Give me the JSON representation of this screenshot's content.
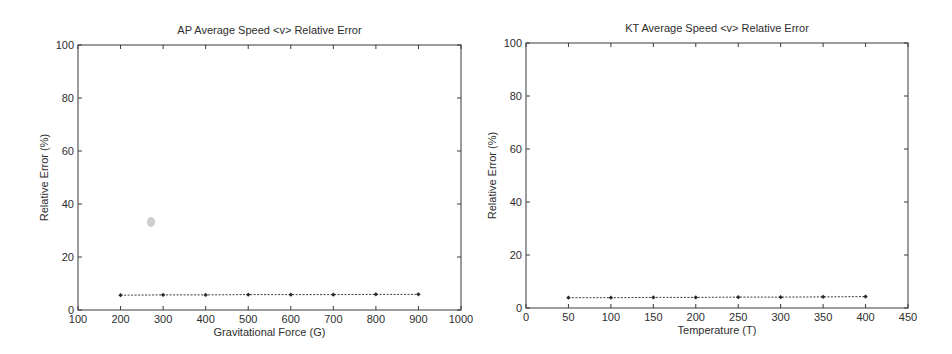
{
  "chart_data": [
    {
      "id": "ap",
      "type": "line",
      "title": "AP Average Speed <v> Relative Error",
      "xlabel": "Gravitational Force (G)",
      "ylabel": "Relative Error (%)",
      "xlim": [
        100,
        1000
      ],
      "ylim": [
        0,
        100
      ],
      "xticks": [
        100,
        200,
        300,
        400,
        500,
        600,
        700,
        800,
        900,
        1000
      ],
      "yticks": [
        0,
        20,
        40,
        60,
        80,
        100
      ],
      "grid": false,
      "legend": null,
      "series": [
        {
          "name": "AP <v> relative error",
          "style": "dotted line with diamond markers",
          "x": [
            200,
            300,
            400,
            500,
            600,
            700,
            800,
            900
          ],
          "y": [
            5.6,
            5.7,
            5.7,
            5.8,
            5.8,
            5.8,
            5.9,
            5.9
          ]
        }
      ],
      "box": {
        "left": 78,
        "top": 45,
        "right": 461,
        "bottom": 310
      }
    },
    {
      "id": "kt",
      "type": "line",
      "title": "KT Average Speed <v> Relative Error",
      "xlabel": "Temperature (T)",
      "ylabel": "Relative Error (%)",
      "xlim": [
        0,
        450
      ],
      "ylim": [
        0,
        100
      ],
      "xticks": [
        0,
        50,
        100,
        150,
        200,
        250,
        300,
        350,
        400,
        450
      ],
      "yticks": [
        0,
        20,
        40,
        60,
        80,
        100
      ],
      "grid": false,
      "legend": null,
      "series": [
        {
          "name": "KT <v> relative error",
          "style": "dotted line with diamond markers",
          "x": [
            50,
            100,
            150,
            200,
            250,
            300,
            350,
            400
          ],
          "y": [
            3.9,
            3.9,
            4.0,
            4.0,
            4.1,
            4.1,
            4.2,
            4.3
          ]
        }
      ],
      "box": {
        "left": 526,
        "top": 43,
        "right": 908,
        "bottom": 308
      }
    }
  ],
  "colors": {
    "axis": "#3a3a3a",
    "text": "#2e2e2e",
    "series": "#2a2a2a",
    "background": "#ffffff"
  }
}
